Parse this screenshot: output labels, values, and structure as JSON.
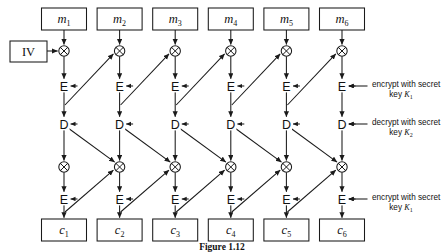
{
  "figure": {
    "caption": "Figure 1.12",
    "columns": 6,
    "plaintext_blocks": [
      {
        "base": "m",
        "sub": "1"
      },
      {
        "base": "m",
        "sub": "2"
      },
      {
        "base": "m",
        "sub": "3"
      },
      {
        "base": "m",
        "sub": "4"
      },
      {
        "base": "m",
        "sub": "5"
      },
      {
        "base": "m",
        "sub": "6"
      }
    ],
    "ciphertext_blocks": [
      {
        "base": "c",
        "sub": "1"
      },
      {
        "base": "c",
        "sub": "2"
      },
      {
        "base": "c",
        "sub": "3"
      },
      {
        "base": "c",
        "sub": "4"
      },
      {
        "base": "c",
        "sub": "5"
      },
      {
        "base": "c",
        "sub": "6"
      }
    ],
    "iv_label": "IV",
    "stage_labels": {
      "encrypt": "E",
      "decrypt": "D",
      "xor": "⊕"
    },
    "annotations": [
      {
        "line1": "encrypt with secret",
        "line2_prefix": "key ",
        "line2_key": "K",
        "line2_sub": "1"
      },
      {
        "line1": "decrypt with secret",
        "line2_prefix": "key ",
        "line2_key": "K",
        "line2_sub": "2"
      },
      {
        "line1": "encrypt with secret",
        "line2_prefix": "key ",
        "line2_key": "K",
        "line2_sub": "1"
      }
    ],
    "colors": {
      "stroke": "#1a1a1a",
      "background": "#ffffff",
      "text": "#111111"
    }
  }
}
